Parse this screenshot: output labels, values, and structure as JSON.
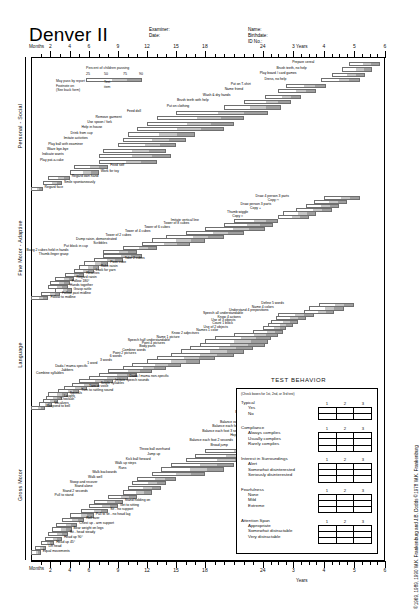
{
  "form": {
    "title": "Denver II",
    "months_label": "Months",
    "years_label": "Years",
    "copyright": "©1969, 1989, 1990 W.K. Frankenburg and J.B. Dodds ©1978 W.K. Frankenburg"
  },
  "header": {
    "examiner_label": "Examiner:",
    "date_label": "Date:",
    "name_label": "Name:",
    "birthdate_label": "Birthdate:",
    "idno_label": "ID No.:"
  },
  "legend": {
    "caption": "Percent of children passing",
    "percents": [
      "25",
      "50",
      "75",
      "90"
    ],
    "test_item_label": "Test item",
    "notes": [
      "May pass by report",
      "Footnote on",
      "(See back form)"
    ]
  },
  "axis": {
    "month_ticks": [
      "2",
      "4",
      "6",
      "9",
      "12",
      "15",
      "18",
      "24"
    ],
    "year_ticks": [
      "3",
      "4",
      "5",
      "6"
    ]
  },
  "domains": [
    {
      "name": "Personal - Social"
    },
    {
      "name": "Fine Motor - Adaptive"
    },
    {
      "name": "Language"
    },
    {
      "name": "Gross Motor"
    }
  ],
  "chart_data": {
    "type": "bar",
    "xlabel": "Age (Months / Years)",
    "ylabel": "Developmental domain",
    "xlim": [
      0,
      72
    ],
    "legend_position": "top-left",
    "grid": false,
    "note": "Each horizontal bar spans the ages at which 25%, 50%, 75% and 90% of children pass the item.",
    "series": [
      {
        "name": "Personal - Social",
        "items": [
          {
            "label": "Prepare cereal",
            "p25": 58.0,
            "p90": 70.0
          },
          {
            "label": "Brush teeth, no help",
            "p25": 55.0,
            "p90": 67.0
          },
          {
            "label": "Play board / card games",
            "p25": 51.0,
            "p90": 64.0
          },
          {
            "label": "Dress, no help",
            "p25": 47.0,
            "p90": 62.0
          },
          {
            "label": "Put on T-shirt",
            "p25": 33.0,
            "p90": 49.0
          },
          {
            "label": "Name friend",
            "p25": 30.0,
            "p90": 45.0
          },
          {
            "label": "Wash & dry hands",
            "p25": 25.0,
            "p90": 39.0
          },
          {
            "label": "Brush teeth with help",
            "p25": 22.0,
            "p90": 35.0
          },
          {
            "label": "Put on clothing",
            "p25": 20.0,
            "p90": 31.0
          },
          {
            "label": "Feed doll",
            "p25": 15.0,
            "p90": 26.0
          },
          {
            "label": "Remove garment",
            "p25": 13.0,
            "p90": 22.0
          },
          {
            "label": "Use spoon / fork",
            "p25": 12.0,
            "p90": 21.0
          },
          {
            "label": "Help in house",
            "p25": 11.0,
            "p90": 20.0
          },
          {
            "label": "Drink from cup",
            "p25": 10.0,
            "p90": 17.0
          },
          {
            "label": "Imitate activities",
            "p25": 9.5,
            "p90": 16.0
          },
          {
            "label": "Play ball with examiner",
            "p25": 9.0,
            "p90": 15.0
          },
          {
            "label": "Wave bye-bye",
            "p25": 7.5,
            "p90": 14.0
          },
          {
            "label": "Indicate wants",
            "p25": 7.0,
            "p90": 14.5
          },
          {
            "label": "Play pat-a-cake",
            "p25": 7.0,
            "p90": 13.0
          },
          {
            "label": "Feed self",
            "p25": 4.5,
            "p90": 8.0
          },
          {
            "label": "Work for toy",
            "p25": 4.0,
            "p90": 7.0
          },
          {
            "label": "Regard own hand",
            "p25": 1.8,
            "p90": 4.0
          },
          {
            "label": "Smile spontaneously",
            "p25": 1.2,
            "p90": 3.2
          },
          {
            "label": "Regard face",
            "p25": 0.0,
            "p90": 1.2
          }
        ]
      },
      {
        "name": "Fine Motor - Adaptive",
        "items": [
          {
            "label": "Draw 4 person 3 parts",
            "p25": 48.0,
            "p90": 62.0
          },
          {
            "label": "Copy □",
            "p25": 44.0,
            "p90": 57.0
          },
          {
            "label": "Draw person 3 parts",
            "p25": 41.0,
            "p90": 54.0
          },
          {
            "label": "Copy +",
            "p25": 37.0,
            "p90": 51.0
          },
          {
            "label": "Thumb wiggle",
            "p25": 32.0,
            "p90": 45.0
          },
          {
            "label": "Copy ○",
            "p25": 30.0,
            "p90": 42.0
          },
          {
            "label": "Imitate vertical line",
            "p25": 21.0,
            "p90": 30.0
          },
          {
            "label": "Tower of 8 cubes",
            "p25": 20.0,
            "p90": 28.0
          },
          {
            "label": "Tower of 6 cubes",
            "p25": 18.0,
            "p90": 25.0
          },
          {
            "label": "Tower of 4 cubes",
            "p25": 16.0,
            "p90": 22.0
          },
          {
            "label": "Tower of 2 cubes",
            "p25": 14.0,
            "p90": 20.0
          },
          {
            "label": "Dump raisin, demonstrated",
            "p25": 12.5,
            "p90": 18.0
          },
          {
            "label": "Scribbles",
            "p25": 11.5,
            "p90": 16.5
          },
          {
            "label": "Put block in cup",
            "p25": 9.5,
            "p90": 13.0
          },
          {
            "label": "Bang 2 cubes held in hands",
            "p25": 7.5,
            "p90": 11.0
          },
          {
            "label": "Thumb-finger grasp",
            "p25": 7.5,
            "p90": 11.5
          },
          {
            "label": "Take 2 cubes",
            "p25": 6.5,
            "p90": 9.5
          },
          {
            "label": "Pass cube",
            "p25": 5.5,
            "p90": 8.0
          },
          {
            "label": "Rake raisin",
            "p25": 5.0,
            "p90": 7.0
          },
          {
            "label": "Look for yarn",
            "p25": 4.5,
            "p90": 6.5
          },
          {
            "label": "Reaches",
            "p25": 3.5,
            "p90": 5.5
          },
          {
            "label": "Regard raisin",
            "p25": 2.5,
            "p90": 4.5
          },
          {
            "label": "Follow 180°",
            "p25": 2.0,
            "p90": 4.0
          },
          {
            "label": "Hands together",
            "p25": 1.8,
            "p90": 3.8
          },
          {
            "label": "Grasp rattle",
            "p25": 2.5,
            "p90": 4.2
          },
          {
            "label": "Follow past midline",
            "p25": 1.0,
            "p90": 3.0
          },
          {
            "label": "Follow to midline",
            "p25": 0.0,
            "p90": 1.8
          }
        ]
      },
      {
        "name": "Language",
        "items": [
          {
            "label": "Define 5 words",
            "p25": 46.0,
            "p90": 60.0
          },
          {
            "label": "Name 4 colors",
            "p25": 42.0,
            "p90": 56.0
          },
          {
            "label": "Understand 4 prepositions",
            "p25": 40.0,
            "p90": 52.0
          },
          {
            "label": "Speech all understandable",
            "p25": 30.0,
            "p90": 44.0
          },
          {
            "label": "Know 4 actions",
            "p25": 29.0,
            "p90": 41.0
          },
          {
            "label": "Use of 3 objects",
            "p25": 27.0,
            "p90": 38.0
          },
          {
            "label": "Count 1 block",
            "p25": 26.0,
            "p90": 36.0
          },
          {
            "label": "Use of 2 objects",
            "p25": 24.0,
            "p90": 33.0
          },
          {
            "label": "Names 1 color",
            "p25": 23.0,
            "p90": 32.0
          },
          {
            "label": "Know 2 adjectives",
            "p25": 21.0,
            "p90": 30.0
          },
          {
            "label": "Name 1 picture",
            "p25": 19.0,
            "p90": 27.0
          },
          {
            "label": "Speech half understandable",
            "p25": 18.0,
            "p90": 26.0
          },
          {
            "label": "Point 4 pictures",
            "p25": 17.5,
            "p90": 25.0
          },
          {
            "label": "Body parts",
            "p25": 16.5,
            "p90": 23.0
          },
          {
            "label": "Combine words",
            "p25": 15.5,
            "p90": 22.0
          },
          {
            "label": "Point 2 pictures",
            "p25": 14.5,
            "p90": 21.0
          },
          {
            "label": "6 words",
            "p25": 13.0,
            "p90": 19.0
          },
          {
            "label": "3 words",
            "p25": 12.0,
            "p90": 17.5
          },
          {
            "label": "1 word",
            "p25": 10.5,
            "p90": 15.5
          },
          {
            "label": "Dada / mama specific",
            "p25": 9.5,
            "p90": 14.0
          },
          {
            "label": "Jabbers",
            "p25": 8.0,
            "p90": 12.5
          },
          {
            "label": "Combine syllables",
            "p25": 7.0,
            "p90": 11.0
          },
          {
            "label": "Dada / mama non-specific",
            "p25": 6.0,
            "p90": 10.0
          },
          {
            "label": "Imitate speech sounds",
            "p25": 5.0,
            "p90": 8.5
          },
          {
            "label": "Single syllables",
            "p25": 4.2,
            "p90": 7.0
          },
          {
            "label": "Turn to voice",
            "p25": 3.4,
            "p90": 5.8
          },
          {
            "label": "Turn to rattling sound",
            "p25": 2.8,
            "p90": 5.0
          },
          {
            "label": "Squeals",
            "p25": 1.8,
            "p90": 3.8
          },
          {
            "label": "Laughs",
            "p25": 1.6,
            "p90": 3.2
          },
          {
            "label": "\"Ooo/aah\"",
            "p25": 1.2,
            "p90": 2.8
          },
          {
            "label": "Vocalizes",
            "p25": 0.8,
            "p90": 2.2
          },
          {
            "label": "Respond to bell",
            "p25": 0.0,
            "p90": 1.4
          }
        ]
      },
      {
        "name": "Gross Motor",
        "items": [
          {
            "label": "Balance each foot 6 seconds",
            "p25": 44.0,
            "p90": 58.0
          },
          {
            "label": "Heel-to-toe walk",
            "p25": 40.0,
            "p90": 54.0
          },
          {
            "label": "Balance each foot 5 seconds",
            "p25": 38.0,
            "p90": 50.0
          },
          {
            "label": "Balance each foot 4 seconds",
            "p25": 35.0,
            "p90": 47.0
          },
          {
            "label": "Balance each foot 3 seconds",
            "p25": 31.0,
            "p90": 43.0
          },
          {
            "label": "Hops",
            "p25": 28.0,
            "p90": 40.0
          },
          {
            "label": "Balance each foot 2 seconds",
            "p25": 26.0,
            "p90": 37.0
          },
          {
            "label": "Broad jump",
            "p25": 24.0,
            "p90": 34.0
          },
          {
            "label": "Throw ball overhand",
            "p25": 18.0,
            "p90": 26.0
          },
          {
            "label": "Jump up",
            "p25": 17.0,
            "p90": 24.0
          },
          {
            "label": "Kick ball forward",
            "p25": 16.0,
            "p90": 23.0
          },
          {
            "label": "Walk up steps",
            "p25": 14.5,
            "p90": 21.0
          },
          {
            "label": "Runs",
            "p25": 13.5,
            "p90": 20.0
          },
          {
            "label": "Walk backwards",
            "p25": 12.5,
            "p90": 18.0
          },
          {
            "label": "Walk well",
            "p25": 11.0,
            "p90": 15.0
          },
          {
            "label": "Stoop and recover",
            "p25": 10.5,
            "p90": 14.0
          },
          {
            "label": "Stand alone",
            "p25": 10.0,
            "p90": 13.5
          },
          {
            "label": "Stand 2 seconds",
            "p25": 9.5,
            "p90": 12.5
          },
          {
            "label": "Pull to stand",
            "p25": 8.0,
            "p90": 11.0
          },
          {
            "label": "Stand holding on",
            "p25": 6.5,
            "p90": 9.5
          },
          {
            "label": "Get to sitting",
            "p25": 6.0,
            "p90": 9.0
          },
          {
            "label": "Sit - no support",
            "p25": 5.2,
            "p90": 8.0
          },
          {
            "label": "Pull to sit - no head lag",
            "p25": 4.0,
            "p90": 6.5
          },
          {
            "label": "Roll over",
            "p25": 3.2,
            "p90": 5.5
          },
          {
            "label": "Chest up - arm support",
            "p25": 2.6,
            "p90": 4.8
          },
          {
            "label": "Bear weight on legs",
            "p25": 2.2,
            "p90": 4.2
          },
          {
            "label": "Sit - head steady",
            "p25": 1.8,
            "p90": 3.8
          },
          {
            "label": "Head up 90°",
            "p25": 1.4,
            "p90": 3.2
          },
          {
            "label": "Head up 45°",
            "p25": 1.0,
            "p90": 2.4
          },
          {
            "label": "Lift head",
            "p25": 0.4,
            "p90": 1.6
          },
          {
            "label": "Equal movements",
            "p25": 0.0,
            "p90": 1.0
          }
        ]
      }
    ]
  },
  "test_behavior": {
    "title": "TEST BEHAVIOR",
    "note": "(Check boxes for 1st, 2nd, or 3rd test)",
    "columns": [
      "1",
      "2",
      "3"
    ],
    "sections": [
      {
        "heading": "Typical",
        "options": [
          "Yes",
          "No"
        ]
      },
      {
        "heading": "Compliance",
        "options": [
          "Always complies",
          "Usually complies",
          "Rarely complies"
        ]
      },
      {
        "heading": "Interest in Surroundings",
        "options": [
          "Alert",
          "Somewhat disinterested",
          "Seriously disinterested"
        ]
      },
      {
        "heading": "Fearfulness",
        "options": [
          "None",
          "Mild",
          "Extreme"
        ]
      },
      {
        "heading": "Attention Span",
        "options": [
          "Appropriate",
          "Somewhat distractable",
          "Very distractable"
        ]
      }
    ]
  }
}
